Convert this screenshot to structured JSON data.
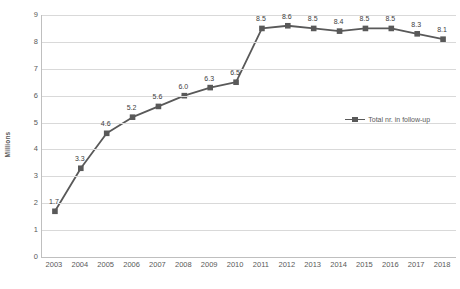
{
  "chart_data": {
    "type": "line",
    "title": "",
    "xlabel": "",
    "ylabel": "Millions",
    "ylim": [
      0,
      9
    ],
    "ytick_step": 1,
    "grid": true,
    "legend_position": "center-right inside plot area",
    "categories": [
      "2003",
      "2004",
      "2005",
      "2006",
      "2007",
      "2008",
      "2009",
      "2010",
      "2011",
      "2012",
      "2013",
      "2014",
      "2015",
      "2016",
      "2017",
      "2018"
    ],
    "yticks": [
      "0",
      "1",
      "2",
      "3",
      "4",
      "5",
      "6",
      "7",
      "8",
      "9"
    ],
    "series": [
      {
        "name": "Total nr. in follow-up",
        "color": "#595959",
        "marker": "square",
        "values": [
          1.7,
          3.3,
          4.6,
          5.2,
          5.6,
          6.0,
          6.3,
          6.5,
          8.5,
          8.6,
          8.5,
          8.4,
          8.5,
          8.5,
          8.3,
          8.1
        ],
        "data_labels": [
          "1.7",
          "3.3",
          "4.6",
          "5.2",
          "5.6",
          "6.0",
          "6.3",
          "6.5",
          "8.5",
          "8.6",
          "8.5",
          "8.4",
          "8.5",
          "8.5",
          "8.3",
          "8.1"
        ]
      }
    ]
  },
  "legend": {
    "entries": [
      {
        "label": "Total nr. in follow-up"
      }
    ]
  },
  "colors": {
    "series": "#595959",
    "gridline": "#d9d9d9",
    "axis": "#bfbfbf",
    "text": "#595959",
    "label_text": "#404040",
    "background": "#ffffff"
  }
}
